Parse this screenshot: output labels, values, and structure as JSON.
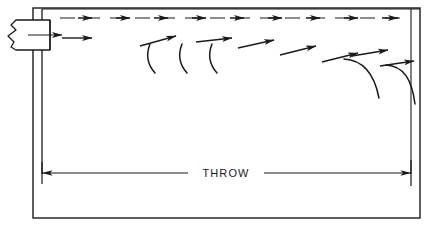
{
  "diagram": {
    "stroke_color": "#1a1a1a",
    "background_color": "#ffffff",
    "labels": {
      "throw": "THROW"
    },
    "components": {
      "outer_frame": {
        "name": "room-outline",
        "x": 33,
        "y": 8,
        "width": 387,
        "height": 210
      },
      "ceiling_line": {
        "name": "ceiling-line",
        "x1": 42,
        "y1": 9,
        "x2": 420,
        "y2": 9
      },
      "left_wall_line": {
        "name": "left-wall-line",
        "x1": 42,
        "y1": 9,
        "x2": 42,
        "y2": 173
      },
      "right_wall_line": {
        "name": "right-wall-line",
        "x1": 411,
        "y1": 9,
        "x2": 411,
        "y2": 173
      },
      "diffuser_box": {
        "name": "diffuser-outlet",
        "x": 8,
        "y": 20,
        "width": 42,
        "height": 30,
        "break_edge": "left"
      }
    },
    "dimension": {
      "name": "throw-dimension",
      "y": 173,
      "x_start": 42,
      "x_end": 411,
      "label": "THROW",
      "label_x": 226,
      "label_y": 177,
      "gap_left": 188,
      "gap_right": 264
    },
    "flow": {
      "primary_stream": {
        "name": "primary-air-stream",
        "y": 18,
        "style": "dashed-with-arrowheads",
        "arrow_x_positions": [
          88,
          126,
          164,
          202,
          240,
          278,
          316,
          354,
          392
        ],
        "dash_pattern": "14 9"
      },
      "secondary_stream": {
        "name": "secondary-air-stream",
        "style": "dashed-descending-with-arrowheads",
        "points": [
          [
            60,
            38
          ],
          [
            108,
            38
          ],
          [
            150,
            40
          ],
          [
            196,
            42
          ],
          [
            246,
            46
          ],
          [
            292,
            52
          ],
          [
            338,
            58
          ],
          [
            384,
            63
          ],
          [
            406,
            66
          ]
        ]
      },
      "vortex_hooks": {
        "name": "induction-curl",
        "count": 3,
        "x_positions": [
          152,
          184,
          214
        ],
        "y_top": 44,
        "height": 28
      },
      "dropoff_curves": {
        "name": "terminal-dropoff-curve",
        "count": 2,
        "x_positions": [
          372,
          412
        ],
        "y_top": 58,
        "height": 42
      }
    }
  }
}
